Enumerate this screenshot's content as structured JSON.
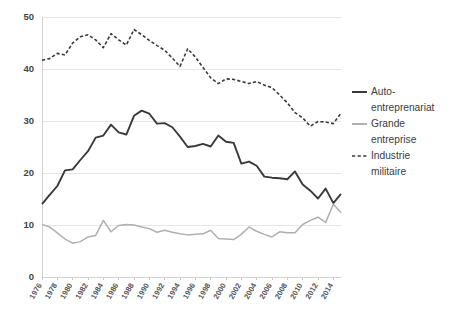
{
  "chart_data": {
    "type": "line",
    "title": "",
    "subtitle": "",
    "xlabel": "",
    "ylabel": "",
    "xlim": [
      1976,
      2015
    ],
    "ylim": [
      0,
      50
    ],
    "grid": true,
    "legend_position": "right",
    "y_ticks": [
      "0",
      "10",
      "20",
      "30",
      "40",
      "50"
    ],
    "y_tick_values": [
      0,
      10,
      20,
      30,
      40,
      50
    ],
    "x_tick_labels": [
      "1976",
      "1978",
      "1980",
      "1982",
      "1984",
      "1986",
      "1988",
      "1990",
      "1992",
      "1994",
      "1996",
      "1998",
      "2000",
      "2002",
      "2004",
      "2006",
      "2008",
      "2010",
      "2012",
      "2014"
    ],
    "x_tick_values": [
      1976,
      1978,
      1980,
      1982,
      1984,
      1986,
      1988,
      1990,
      1992,
      1994,
      1996,
      1998,
      2000,
      2002,
      2004,
      2006,
      2008,
      2010,
      2012,
      2014
    ],
    "x": [
      1976,
      1977,
      1978,
      1979,
      1980,
      1981,
      1982,
      1983,
      1984,
      1985,
      1986,
      1987,
      1988,
      1989,
      1990,
      1991,
      1992,
      1993,
      1994,
      1995,
      1996,
      1997,
      1998,
      1999,
      2000,
      2001,
      2002,
      2003,
      2004,
      2005,
      2006,
      2007,
      2008,
      2009,
      2010,
      2011,
      2012,
      2013,
      2014,
      2015
    ],
    "series": [
      {
        "name": "Auto-entreprenariat",
        "style": "solid",
        "color": "#3a3a3a",
        "width": 1.9,
        "values": [
          14.0,
          15.8,
          17.5,
          20.5,
          20.7,
          22.5,
          24.2,
          26.8,
          27.2,
          29.3,
          27.8,
          27.4,
          31.0,
          32.0,
          31.4,
          29.5,
          29.6,
          28.8,
          27.0,
          25.0,
          25.2,
          25.6,
          25.1,
          27.2,
          26.0,
          25.8,
          21.8,
          22.2,
          21.4,
          19.3,
          19.1,
          19.0,
          18.8,
          20.3,
          17.8,
          16.6,
          15.1,
          17.0,
          14.2,
          16.0
        ]
      },
      {
        "name": "Grande entreprise",
        "style": "solid",
        "color": "#b0b0b0",
        "width": 1.5,
        "values": [
          10.1,
          9.6,
          8.5,
          7.3,
          6.5,
          6.8,
          7.7,
          8.0,
          10.9,
          8.7,
          9.9,
          10.1,
          10.0,
          9.6,
          9.3,
          8.6,
          9.0,
          8.6,
          8.3,
          8.1,
          8.2,
          8.3,
          9.0,
          7.4,
          7.3,
          7.2,
          8.2,
          9.6,
          8.8,
          8.2,
          7.7,
          8.7,
          8.5,
          8.5,
          10.1,
          10.9,
          11.5,
          10.5,
          14.0,
          12.4
        ]
      },
      {
        "name": "Industrie militaire",
        "style": "dashed",
        "color": "#3a3a3a",
        "width": 1.6,
        "values": [
          41.7,
          42.0,
          43.0,
          42.7,
          45.0,
          46.2,
          46.6,
          45.6,
          44.1,
          46.8,
          45.6,
          44.6,
          47.6,
          46.6,
          45.5,
          44.5,
          43.6,
          42.1,
          40.5,
          43.9,
          42.3,
          40.3,
          38.3,
          37.2,
          38.1,
          38.0,
          37.6,
          37.2,
          37.6,
          36.9,
          36.4,
          35.0,
          33.5,
          31.6,
          30.6,
          29.0,
          29.9,
          29.8,
          29.5,
          31.5
        ]
      }
    ],
    "legend": [
      {
        "label": "Auto-\nentreprenariat",
        "style": "solid",
        "color": "#3a3a3a"
      },
      {
        "label": "Grande\nentreprise",
        "style": "solid",
        "color": "#b0b0b0"
      },
      {
        "label": "Industrie\nmilitaire",
        "style": "dashed",
        "color": "#3a3a3a"
      }
    ],
    "colors": {
      "gridline": "#e6e6e6",
      "axis": "#d2d2d2",
      "background": "#ffffff",
      "tick_text": "#55565a"
    }
  }
}
